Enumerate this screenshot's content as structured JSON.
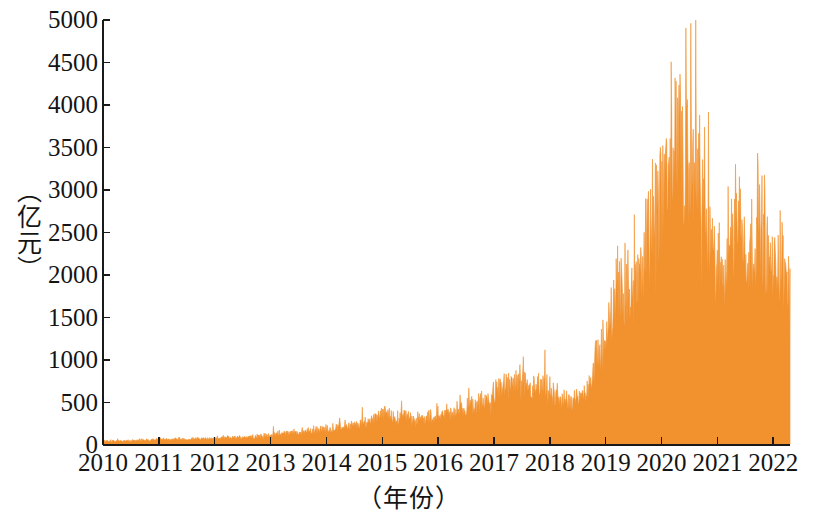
{
  "chart_data": {
    "type": "area",
    "title": "",
    "subtitle": "",
    "xlabel": "（年份）",
    "ylabel": "（亿元）",
    "series_color": "#f2922f",
    "axis_color": "#1a1a1a",
    "background": "#ffffff",
    "grid": false,
    "legend": null,
    "legend_position": "none",
    "xlim": [
      2010,
      2022.3
    ],
    "ylim": [
      0,
      5000
    ],
    "ytick_labels": [
      "0",
      "500",
      "1000",
      "1500",
      "2000",
      "2500",
      "3000",
      "3500",
      "4000",
      "4500",
      "5000"
    ],
    "ytick_values": [
      0,
      500,
      1000,
      1500,
      2000,
      2500,
      3000,
      3500,
      4000,
      4500,
      5000
    ],
    "xtick_labels": [
      "2010",
      "2011",
      "2012",
      "2013",
      "2014",
      "2015",
      "2016",
      "2017",
      "2018",
      "2019",
      "2020",
      "2021",
      "2022"
    ],
    "xtick_values": [
      2010,
      2011,
      2012,
      2013,
      2014,
      2015,
      2016,
      2017,
      2018,
      2019,
      2020,
      2021,
      2022
    ],
    "note": "High-frequency (daily) turnover series; values below are the monthly envelope read from the plot.",
    "x": [
      2010.0,
      2010.08,
      2010.17,
      2010.25,
      2010.33,
      2010.42,
      2010.5,
      2010.58,
      2010.67,
      2010.75,
      2010.83,
      2010.92,
      2011.0,
      2011.08,
      2011.17,
      2011.25,
      2011.33,
      2011.42,
      2011.5,
      2011.58,
      2011.67,
      2011.75,
      2011.83,
      2011.92,
      2012.0,
      2012.08,
      2012.17,
      2012.25,
      2012.33,
      2012.42,
      2012.5,
      2012.58,
      2012.67,
      2012.75,
      2012.83,
      2012.92,
      2013.0,
      2013.08,
      2013.17,
      2013.25,
      2013.33,
      2013.42,
      2013.5,
      2013.58,
      2013.67,
      2013.75,
      2013.83,
      2013.92,
      2014.0,
      2014.08,
      2014.17,
      2014.25,
      2014.33,
      2014.42,
      2014.5,
      2014.58,
      2014.67,
      2014.75,
      2014.83,
      2014.92,
      2015.0,
      2015.08,
      2015.17,
      2015.25,
      2015.33,
      2015.42,
      2015.5,
      2015.58,
      2015.67,
      2015.75,
      2015.83,
      2015.92,
      2016.0,
      2016.08,
      2016.17,
      2016.25,
      2016.33,
      2016.42,
      2016.5,
      2016.58,
      2016.67,
      2016.75,
      2016.83,
      2016.92,
      2017.0,
      2017.08,
      2017.17,
      2017.25,
      2017.33,
      2017.42,
      2017.5,
      2017.58,
      2017.67,
      2017.75,
      2017.83,
      2017.92,
      2018.0,
      2018.08,
      2018.17,
      2018.25,
      2018.33,
      2018.42,
      2018.5,
      2018.58,
      2018.67,
      2018.75,
      2018.83,
      2018.92,
      2019.0,
      2019.08,
      2019.17,
      2019.25,
      2019.33,
      2019.42,
      2019.5,
      2019.58,
      2019.67,
      2019.75,
      2019.83,
      2019.92,
      2020.0,
      2020.08,
      2020.17,
      2020.25,
      2020.33,
      2020.42,
      2020.5,
      2020.58,
      2020.67,
      2020.75,
      2020.83,
      2020.92,
      2021.0,
      2021.08,
      2021.17,
      2021.25,
      2021.33,
      2021.42,
      2021.5,
      2021.58,
      2021.67,
      2021.75,
      2021.83,
      2021.92,
      2022.0,
      2022.08,
      2022.17,
      2022.25
    ],
    "values": [
      55,
      60,
      58,
      62,
      57,
      60,
      63,
      66,
      70,
      68,
      72,
      75,
      78,
      80,
      76,
      82,
      85,
      80,
      84,
      88,
      86,
      90,
      95,
      92,
      96,
      100,
      98,
      104,
      108,
      106,
      112,
      118,
      120,
      124,
      128,
      132,
      138,
      150,
      160,
      168,
      172,
      180,
      176,
      188,
      196,
      204,
      212,
      220,
      228,
      236,
      244,
      252,
      260,
      268,
      276,
      290,
      310,
      340,
      380,
      430,
      470,
      440,
      400,
      380,
      400,
      420,
      400,
      370,
      350,
      360,
      380,
      400,
      420,
      440,
      460,
      470,
      480,
      500,
      520,
      540,
      560,
      580,
      600,
      640,
      700,
      760,
      800,
      780,
      820,
      860,
      840,
      800,
      760,
      780,
      800,
      770,
      740,
      700,
      660,
      620,
      600,
      580,
      620,
      700,
      820,
      980,
      1150,
      1300,
      1450,
      1700,
      2100,
      2400,
      2200,
      2000,
      2150,
      2400,
      2700,
      2900,
      3100,
      3300,
      3600,
      3900,
      4100,
      4350,
      4200,
      4000,
      3800,
      4000,
      3700,
      3400,
      3000,
      2700,
      2500,
      2400,
      2600,
      3000,
      3350,
      3100,
      2800,
      2600,
      2900,
      3150,
      2900,
      2600,
      2400,
      2600,
      2550,
      2300
    ]
  },
  "axes": {
    "y_axis_name": "value-axis",
    "x_axis_name": "year-axis"
  },
  "caption": {
    "text": ""
  }
}
